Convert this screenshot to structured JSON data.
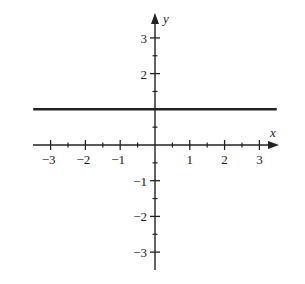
{
  "chart_data": {
    "type": "line",
    "title": "",
    "xlabel": "x",
    "ylabel": "y",
    "xlim": [
      -3.5,
      3.5
    ],
    "ylim": [
      -3.5,
      3.5
    ],
    "grid": false,
    "legend": null,
    "x_ticks": [
      -3,
      -2,
      -1,
      1,
      2,
      3
    ],
    "x_tick_labels": [
      "−3",
      "−2",
      "−1",
      "1",
      "2",
      "3"
    ],
    "y_ticks": [
      3,
      2,
      -1,
      -2,
      -3
    ],
    "y_tick_labels": [
      "3",
      "2",
      "−1",
      "−2",
      "−3"
    ],
    "minor_tick_step": 0.5,
    "series": [
      {
        "name": "y = 1",
        "x": [
          -3.5,
          3.5
        ],
        "y": [
          1,
          1
        ],
        "color": "#222222"
      }
    ]
  },
  "labels": {
    "x_axis": "x",
    "y_axis": "y"
  }
}
